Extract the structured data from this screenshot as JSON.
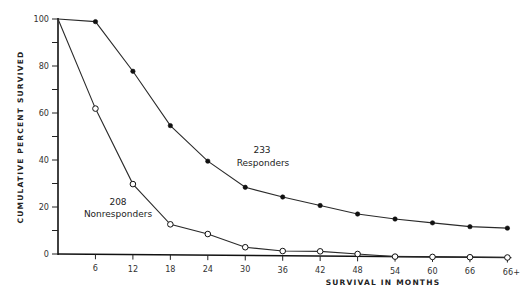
{
  "chart_data": {
    "type": "line",
    "title": "",
    "xlabel": "SURVIVAL IN MONTHS",
    "ylabel": "CUMULATIVE PERCENT SURVIVED",
    "x": [
      0,
      6,
      12,
      18,
      24,
      30,
      36,
      42,
      48,
      54,
      60,
      66,
      "66+"
    ],
    "x_tick_labels": [
      "6",
      "12",
      "18",
      "24",
      "30",
      "36",
      "42",
      "48",
      "54",
      "60",
      "66",
      "66+"
    ],
    "y_tick_labels": [
      "0",
      "20",
      "40",
      "60",
      "80",
      "100"
    ],
    "ylim": [
      0,
      100
    ],
    "grid": false,
    "legend": "none (inline annotations)",
    "series": [
      {
        "name": "Responders",
        "n": "233",
        "marker": "filled-circle",
        "values": [
          100,
          99,
          78,
          55,
          40,
          29,
          25,
          21.5,
          18,
          16,
          14.5,
          13,
          12.5
        ]
      },
      {
        "name": "Nonresponders",
        "n": "208",
        "marker": "open-circle",
        "values": [
          100,
          62,
          30,
          13,
          9,
          3.5,
          2,
          2,
          1,
          0,
          0,
          0,
          0
        ]
      }
    ],
    "annotations": [
      {
        "text": "233",
        "subtext": "Responders",
        "near_series": "Responders"
      },
      {
        "text": "208",
        "subtext": "Nonresponders",
        "near_series": "Nonresponders"
      }
    ]
  },
  "labels": {
    "ylabel": "CUMULATIVE PERCENT SURVIVED",
    "xlabel": "SURVIVAL IN MONTHS",
    "responders_n": "233",
    "responders_name": "Responders",
    "nonresponders_n": "208",
    "nonresponders_name": "Nonresponders"
  }
}
